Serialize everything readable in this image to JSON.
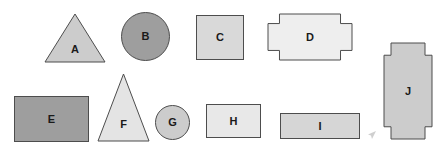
{
  "canvas": {
    "width": 444,
    "height": 153,
    "background": "#ffffff",
    "stroke_color": "#4d4d4d"
  },
  "palette": {
    "light_gray": "#eeeeee",
    "pale_gray": "#e4e4e4",
    "mid_light_gray": "#d9d9d9",
    "mid_gray": "#cccccc",
    "dark_gray": "#9e9e9e",
    "outline": "#4d4d4d",
    "label_color": "#1a1a1a"
  },
  "shapes": [
    {
      "id": "A",
      "label": "A",
      "kind": "triangle",
      "fill": "#cccccc",
      "x": 44,
      "y": 13,
      "width": 62,
      "height": 50,
      "label_x": 0.5,
      "label_y": 0.72
    },
    {
      "id": "B",
      "label": "B",
      "kind": "circle",
      "fill": "#9e9e9e",
      "x": 121,
      "y": 12,
      "width": 49,
      "height": 49,
      "label_x": 0.5,
      "label_y": 0.5
    },
    {
      "id": "C",
      "label": "C",
      "kind": "rectangle",
      "fill": "#d9d9d9",
      "x": 196,
      "y": 15,
      "width": 48,
      "height": 45,
      "label_x": 0.5,
      "label_y": 0.5
    },
    {
      "id": "D",
      "label": "D",
      "kind": "cross-horizontal",
      "fill": "#eeeeee",
      "x": 267,
      "y": 13,
      "width": 86,
      "height": 48,
      "label_x": 0.5,
      "label_y": 0.5
    },
    {
      "id": "E",
      "label": "E",
      "kind": "rectangle",
      "fill": "#9e9e9e",
      "x": 14,
      "y": 96,
      "width": 75,
      "height": 46,
      "label_x": 0.5,
      "label_y": 0.5
    },
    {
      "id": "F",
      "label": "F",
      "kind": "triangle",
      "fill": "#e4e4e4",
      "x": 97,
      "y": 73,
      "width": 53,
      "height": 69,
      "label_x": 0.5,
      "label_y": 0.74
    },
    {
      "id": "G",
      "label": "G",
      "kind": "circle",
      "fill": "#cccccc",
      "x": 155,
      "y": 105,
      "width": 35,
      "height": 35,
      "label_x": 0.5,
      "label_y": 0.5
    },
    {
      "id": "H",
      "label": "H",
      "kind": "rectangle",
      "fill": "#e8e8e8",
      "x": 206,
      "y": 104,
      "width": 55,
      "height": 34,
      "label_x": 0.5,
      "label_y": 0.5
    },
    {
      "id": "I",
      "label": "I",
      "kind": "rectangle",
      "fill": "#d6d6d6",
      "x": 280,
      "y": 113,
      "width": 80,
      "height": 26,
      "label_x": 0.5,
      "label_y": 0.5
    },
    {
      "id": "J",
      "label": "J",
      "kind": "cross-vertical",
      "fill": "#cccccc",
      "x": 383,
      "y": 42,
      "width": 50,
      "height": 98,
      "label_x": 0.5,
      "label_y": 0.5
    }
  ],
  "cursor": {
    "name": "mouse-pointer",
    "x": 368,
    "y": 126
  }
}
